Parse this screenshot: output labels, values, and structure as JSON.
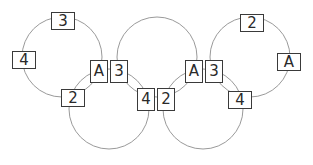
{
  "diagram": {
    "type": "interlocking-rings-puzzle",
    "rings": [
      {
        "id": "ring-1",
        "cx": 62,
        "cy": 57,
        "r": 40
      },
      {
        "id": "ring-2",
        "cx": 109,
        "cy": 109,
        "r": 40
      },
      {
        "id": "ring-3",
        "cx": 157,
        "cy": 57,
        "r": 40
      },
      {
        "id": "ring-4",
        "cx": 203,
        "cy": 109,
        "r": 40
      },
      {
        "id": "ring-5",
        "cx": 250,
        "cy": 57,
        "r": 40
      }
    ],
    "ring_color": "#9a9a9a",
    "labels": [
      {
        "text": "3",
        "x": 51,
        "y": 12,
        "o": "h"
      },
      {
        "text": "4",
        "x": 12,
        "y": 51,
        "o": "h"
      },
      {
        "text": "A",
        "x": 90,
        "y": 60,
        "o": "v"
      },
      {
        "text": "3",
        "x": 110,
        "y": 60,
        "o": "v"
      },
      {
        "text": "2",
        "x": 61,
        "y": 89,
        "o": "h"
      },
      {
        "text": "4",
        "x": 137,
        "y": 88,
        "o": "v"
      },
      {
        "text": "2",
        "x": 157,
        "y": 88,
        "o": "v"
      },
      {
        "text": "A",
        "x": 185,
        "y": 60,
        "o": "v"
      },
      {
        "text": "3",
        "x": 205,
        "y": 60,
        "o": "v"
      },
      {
        "text": "2",
        "x": 240,
        "y": 14,
        "o": "h"
      },
      {
        "text": "A",
        "x": 277,
        "y": 53,
        "o": "h"
      },
      {
        "text": "4",
        "x": 228,
        "y": 91,
        "o": "h"
      }
    ]
  }
}
